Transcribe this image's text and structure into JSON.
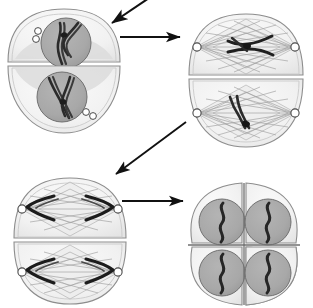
{
  "figure": {
    "title": "Cell division stages diagram",
    "background_color": "#ffffff",
    "line_color": "#1a1a1a"
  },
  "palette": {
    "background": "#ffffff",
    "cytoplasm_fill": "#f2f2f2",
    "cytoplasm_stroke": "#8f8f8f",
    "cytoplasm_inner_shade": "#e2e2e2",
    "nucleus_fill": "#a9a9a9",
    "nucleus_stroke": "#6e6e6e",
    "chromosome_dark": "#2b2b2b",
    "chromosome_mid": "#555555",
    "spindle_fiber": "#9a9a9a",
    "spindle_outline": "#a2a2a2",
    "centriole_fill": "#ffffff",
    "centriole_stroke": "#4a4a4a",
    "arrow_color": "#111111"
  },
  "panels": [
    {
      "id": "panel-1",
      "name": "prophase-cell-pair",
      "position": "top-left",
      "stage_label": "Prophase II",
      "cells": [
        {
          "id": "cell-1-upper",
          "nucleus_present": true,
          "chromosome_count": 2,
          "chromosome_shape": "paired-sister-chromatids",
          "centriole_pairs": 1,
          "centriole_position": "upper-left"
        },
        {
          "id": "cell-1-lower",
          "nucleus_present": true,
          "chromosome_count": 2,
          "chromosome_shape": "paired-sister-chromatids",
          "centriole_pairs": 1,
          "centriole_position": "lower-right"
        }
      ]
    },
    {
      "id": "panel-2",
      "name": "metaphase-cell-pair",
      "position": "top-right",
      "stage_label": "Metaphase II",
      "cells": [
        {
          "id": "cell-2-upper",
          "nucleus_present": false,
          "spindle_present": true,
          "chromosome_count": 2,
          "chromosome_shape": "aligned-at-equator",
          "pole_count": 2
        },
        {
          "id": "cell-2-lower",
          "nucleus_present": false,
          "spindle_present": true,
          "chromosome_count": 2,
          "chromosome_shape": "aligned-at-equator",
          "pole_count": 2
        }
      ]
    },
    {
      "id": "panel-3",
      "name": "anaphase-cell-pair",
      "position": "bottom-left",
      "stage_label": "Anaphase II",
      "cells": [
        {
          "id": "cell-3-upper",
          "nucleus_present": false,
          "spindle_present": true,
          "chromosome_count": 2,
          "chromosome_shape": "separated-toward-poles",
          "pole_count": 2
        },
        {
          "id": "cell-3-lower",
          "nucleus_present": false,
          "spindle_present": true,
          "chromosome_count": 2,
          "chromosome_shape": "separated-toward-poles",
          "pole_count": 2
        }
      ]
    },
    {
      "id": "panel-4",
      "name": "four-daughter-cells",
      "position": "bottom-right",
      "stage_label": "Telophase II / four haploid cells",
      "cells": [
        {
          "id": "daughter-cell-top-left",
          "nucleus_present": true,
          "chromosome_count": 1,
          "chromosome_shape": "single-s-curve"
        },
        {
          "id": "daughter-cell-top-right",
          "nucleus_present": true,
          "chromosome_count": 1,
          "chromosome_shape": "single-s-curve"
        },
        {
          "id": "daughter-cell-bottom-left",
          "nucleus_present": true,
          "chromosome_count": 1,
          "chromosome_shape": "single-s-curve"
        },
        {
          "id": "daughter-cell-bottom-right",
          "nucleus_present": true,
          "chromosome_count": 1,
          "chromosome_shape": "single-s-curve"
        }
      ]
    }
  ],
  "arrows": [
    {
      "id": "arrow-incoming-top",
      "name": "arrow-into-panel-1",
      "direction": "down-left",
      "from": "off-canvas-top",
      "to": "panel-1"
    },
    {
      "id": "arrow-1-to-2",
      "name": "arrow-panel-1-to-panel-2",
      "direction": "right",
      "from": "panel-1",
      "to": "panel-2"
    },
    {
      "id": "arrow-2-to-3",
      "name": "arrow-panel-2-to-panel-3",
      "direction": "down-left",
      "from": "panel-2",
      "to": "panel-3"
    },
    {
      "id": "arrow-3-to-4",
      "name": "arrow-panel-3-to-panel-4",
      "direction": "right",
      "from": "panel-3",
      "to": "panel-4"
    }
  ]
}
